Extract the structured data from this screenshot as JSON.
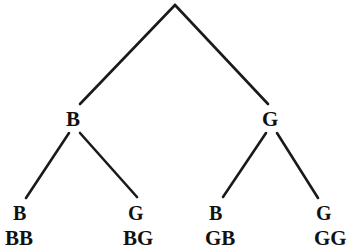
{
  "diagram": {
    "type": "probability-tree-diagram",
    "line_color": "#1a1a1a",
    "text_color": "#111111",
    "background_color": "#ffffff",
    "root": {
      "label": "",
      "x": 175,
      "y": 4
    },
    "level1": [
      {
        "id": "b",
        "label": "B",
        "x": 73,
        "y": 119
      },
      {
        "id": "g",
        "label": "G",
        "x": 270,
        "y": 119
      }
    ],
    "level2": [
      {
        "id": "bb",
        "label": "B",
        "x": 20,
        "y": 213
      },
      {
        "id": "bg",
        "label": "G",
        "x": 135,
        "y": 213
      },
      {
        "id": "gb",
        "label": "B",
        "x": 216,
        "y": 213
      },
      {
        "id": "gg",
        "label": "G",
        "x": 323,
        "y": 213
      }
    ],
    "outcomes": [
      {
        "id": "bb",
        "label": "BB",
        "x": 22,
        "y": 238
      },
      {
        "id": "bg",
        "label": "BG",
        "x": 140,
        "y": 238
      },
      {
        "id": "gb",
        "label": "GB",
        "x": 222,
        "y": 238
      },
      {
        "id": "gg",
        "label": "GG",
        "x": 332,
        "y": 238
      }
    ],
    "edges": [
      {
        "id": "root-b",
        "from": "root",
        "to": "b",
        "x1": 175,
        "y1": 5,
        "x2": 80,
        "y2": 104
      },
      {
        "id": "root-g",
        "from": "root",
        "to": "g",
        "x1": 175,
        "y1": 5,
        "x2": 268,
        "y2": 104
      },
      {
        "id": "b-bb",
        "from": "b",
        "to": "bb",
        "x1": 69,
        "y1": 133,
        "x2": 26,
        "y2": 198
      },
      {
        "id": "b-bg",
        "from": "b",
        "to": "bg",
        "x1": 80,
        "y1": 133,
        "x2": 137,
        "y2": 197
      },
      {
        "id": "g-gb",
        "from": "g",
        "to": "gb",
        "x1": 266,
        "y1": 133,
        "x2": 223,
        "y2": 197
      },
      {
        "id": "g-gg",
        "from": "g",
        "to": "gg",
        "x1": 277,
        "y1": 133,
        "x2": 318,
        "y2": 198
      }
    ]
  }
}
